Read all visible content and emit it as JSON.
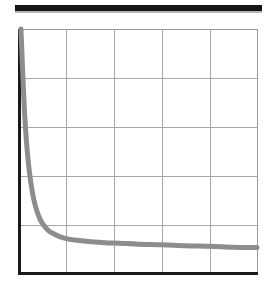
{
  "figure": {
    "kind": "scanned-figure",
    "background_color": "#ffffff",
    "rule_color": "#141414",
    "axis_color": "#1a1a1a",
    "grid_color": "#a8a8a8",
    "curve_color": "#8d8d8d"
  },
  "chart_data": {
    "type": "line",
    "title": "",
    "subtitle": "",
    "xlabel": "",
    "ylabel": "",
    "xlim": [
      0,
      5
    ],
    "ylim": [
      0,
      5
    ],
    "grid": true,
    "grid_x_ticks": [
      1,
      2,
      3,
      4
    ],
    "grid_y_ticks": [
      1,
      2,
      3,
      4
    ],
    "xtick_labels": [],
    "ytick_labels": [],
    "legend": [],
    "legend_position": "none",
    "annotations": [],
    "series": [
      {
        "name": "decay",
        "style": "solid",
        "color": "#8d8d8d",
        "linewidth": 5,
        "x": [
          0.02,
          0.04,
          0.06,
          0.08,
          0.1,
          0.13,
          0.16,
          0.2,
          0.25,
          0.3,
          0.36,
          0.43,
          0.5,
          0.6,
          0.7,
          0.85,
          1.0,
          1.2,
          1.5,
          1.8,
          2.1,
          2.5,
          3.0,
          3.5,
          4.0,
          4.5,
          5.0
        ],
        "y": [
          5.0,
          4.52,
          4.05,
          3.6,
          3.22,
          2.78,
          2.42,
          2.06,
          1.72,
          1.47,
          1.26,
          1.09,
          0.98,
          0.87,
          0.81,
          0.74,
          0.7,
          0.67,
          0.64,
          0.62,
          0.61,
          0.59,
          0.58,
          0.56,
          0.55,
          0.53,
          0.52
        ]
      }
    ]
  }
}
